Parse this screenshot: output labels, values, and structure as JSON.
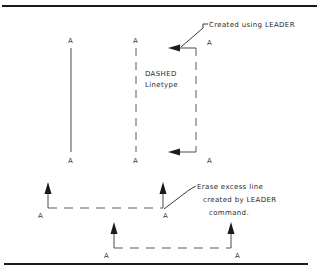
{
  "drawing": {
    "title": "LEADER linetype illustration",
    "colors": {
      "line": "#4a4a4a",
      "dashed": "#5a5a5a",
      "text": "#2b2b2b",
      "rule": "#1a1a1a",
      "background": "#ffffff"
    }
  },
  "annotations": {
    "leader_top": "Created using LEADER",
    "linetype_name": "DASHED",
    "linetype_word": "Linetype",
    "erase_line_1": "Erase excess line",
    "erase_line_2": "created by LEADER",
    "erase_line_3": "command."
  },
  "point_labels": {
    "solid_top": "A",
    "solid_bottom": "A",
    "dashed_top": "A",
    "dashed_bottom": "A",
    "leader_top": "A",
    "leader_bottom": "A",
    "horiz_left": "A",
    "horiz_right": "A",
    "lower_left": "A",
    "lower_right": "A"
  }
}
